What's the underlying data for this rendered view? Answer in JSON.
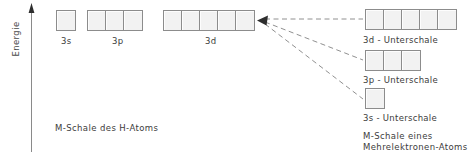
{
  "figure": {
    "axis": {
      "label": "Energie",
      "icon": "up-arrow-icon"
    },
    "left_shell": {
      "caption": "M-Schale des H-Atoms",
      "orbitals": [
        {
          "label": "3s",
          "boxes": 1,
          "x": 56,
          "width": 22
        },
        {
          "label": "3p",
          "boxes": 3,
          "x": 87,
          "width": 62
        },
        {
          "label": "3d",
          "boxes": 5,
          "x": 163,
          "width": 96
        }
      ]
    },
    "right_shell": {
      "caption_line1": "M-Schale eines",
      "caption_line2": "Mehrelektronen-Atoms",
      "subshells": [
        {
          "label": "3d - Unterschale",
          "boxes": 5,
          "y": 9,
          "width": 96
        },
        {
          "label": "3p - Unterschale",
          "boxes": 3,
          "y": 50,
          "width": 62
        },
        {
          "label": "3s - Unterschale",
          "boxes": 1,
          "y": 88,
          "width": 22
        }
      ]
    },
    "connectors": {
      "name": "dashed-splitting-lines",
      "arrow_tip_x": 259,
      "arrow_tip_y": 20,
      "count": 3
    },
    "colors": {
      "box_fill": "#f2f2f2",
      "box_border": "#8c8c8c",
      "text": "#3c3c3c",
      "dashed_line": "#8c8c8c",
      "axis": "#6e6e6e"
    }
  }
}
